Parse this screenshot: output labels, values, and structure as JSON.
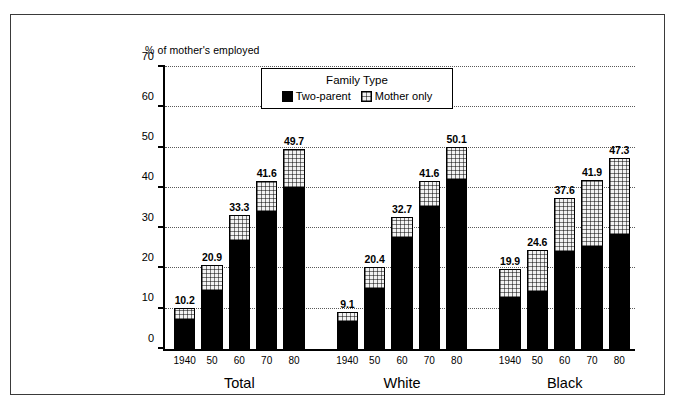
{
  "chart_data": {
    "type": "bar",
    "subtype": "stacked-grouped",
    "title": "",
    "ylabel": "% of mother's employed",
    "xlabel": "",
    "ylim": [
      0,
      70
    ],
    "yticks": [
      0,
      10,
      20,
      30,
      40,
      50,
      60,
      70
    ],
    "grid": true,
    "grid_style": "dotted-horizontal",
    "legend": {
      "title": "Family Type",
      "position": "inside-top-center",
      "entries": [
        {
          "name": "Two-parent",
          "color": "#000000",
          "pattern": "solid"
        },
        {
          "name": "Mother only",
          "color": "#f2f2f2",
          "pattern": "grid-hatch"
        }
      ]
    },
    "group_labels": [
      "Total",
      "White",
      "Black"
    ],
    "categories": [
      "1940",
      "50",
      "60",
      "70",
      "80"
    ],
    "groups": [
      {
        "label": "Total",
        "bars": [
          {
            "category": "1940",
            "total": 10.2,
            "two_parent": 7.1,
            "mother_only": 3.1,
            "label": "10.2"
          },
          {
            "category": "50",
            "total": 20.9,
            "two_parent": 14.5,
            "mother_only": 6.4,
            "label": "20.9"
          },
          {
            "category": "60",
            "total": 33.3,
            "two_parent": 26.9,
            "mother_only": 6.4,
            "label": "33.3"
          },
          {
            "category": "70",
            "total": 41.6,
            "two_parent": 33.9,
            "mother_only": 7.7,
            "label": "41.6"
          },
          {
            "category": "80",
            "total": 49.7,
            "two_parent": 39.9,
            "mother_only": 9.8,
            "label": "49.7"
          }
        ]
      },
      {
        "label": "White",
        "bars": [
          {
            "category": "1940",
            "total": 9.1,
            "two_parent": 6.6,
            "mother_only": 2.5,
            "label": "9.1"
          },
          {
            "category": "50",
            "total": 20.4,
            "two_parent": 15.0,
            "mother_only": 5.4,
            "label": "20.4"
          },
          {
            "category": "60",
            "total": 32.7,
            "two_parent": 27.6,
            "mother_only": 5.1,
            "label": "32.7"
          },
          {
            "category": "70",
            "total": 41.6,
            "two_parent": 35.2,
            "mother_only": 6.4,
            "label": "41.6"
          },
          {
            "category": "80",
            "total": 50.1,
            "two_parent": 42.0,
            "mother_only": 8.1,
            "label": "50.1"
          }
        ]
      },
      {
        "label": "Black",
        "bars": [
          {
            "category": "1940",
            "total": 19.9,
            "two_parent": 12.7,
            "mother_only": 7.2,
            "label": "19.9"
          },
          {
            "category": "50",
            "total": 24.6,
            "two_parent": 14.2,
            "mother_only": 10.4,
            "label": "24.6"
          },
          {
            "category": "60",
            "total": 37.6,
            "two_parent": 24.0,
            "mother_only": 13.6,
            "label": "37.6"
          },
          {
            "category": "70",
            "total": 41.9,
            "two_parent": 25.4,
            "mother_only": 16.5,
            "label": "41.9"
          },
          {
            "category": "80",
            "total": 47.3,
            "two_parent": 28.2,
            "mother_only": 19.1,
            "label": "47.3"
          }
        ]
      }
    ]
  },
  "colors": {
    "two_parent": "#000000",
    "mother_only": "#f2f2f2",
    "axis": "#000000",
    "frame": "#3a3a3a",
    "background": "#ffffff"
  }
}
